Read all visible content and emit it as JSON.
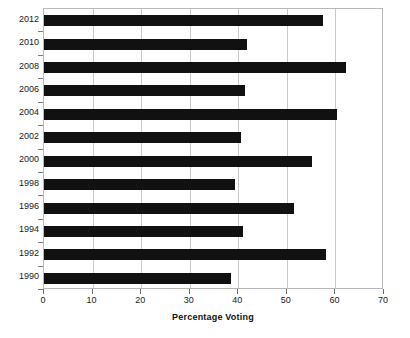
{
  "chart_data": {
    "type": "bar",
    "orientation": "horizontal",
    "title": "",
    "xlabel": "Percentage Voting",
    "ylabel": "",
    "categories": [
      "1990",
      "1992",
      "1994",
      "1996",
      "1998",
      "2000",
      "2002",
      "2004",
      "2006",
      "2008",
      "2010",
      "2012"
    ],
    "values": [
      38.5,
      58.1,
      41.0,
      51.4,
      39.4,
      55.2,
      40.5,
      60.4,
      41.3,
      62.2,
      41.8,
      57.5
    ],
    "series": [
      {
        "name": "Percentage Voting",
        "values": [
          38.5,
          58.1,
          41.0,
          51.4,
          39.4,
          55.2,
          40.5,
          60.4,
          41.3,
          62.2,
          41.8,
          57.5
        ]
      }
    ],
    "display_order_top_to_bottom": [
      "2012",
      "2010",
      "2008",
      "2006",
      "2004",
      "2002",
      "2000",
      "1998",
      "1996",
      "1994",
      "1992",
      "1990"
    ],
    "xlim": [
      0,
      70
    ],
    "xticks": [
      0,
      10,
      20,
      30,
      40,
      50,
      60,
      70
    ],
    "xtick_labels": [
      "0",
      "10",
      "20",
      "30",
      "40",
      "50",
      "60",
      "70"
    ],
    "grid": "vertical",
    "legend": "none",
    "bar_color": "#111111",
    "grid_color": "#c9c9c9",
    "frame_color": "#b9b9b9"
  }
}
